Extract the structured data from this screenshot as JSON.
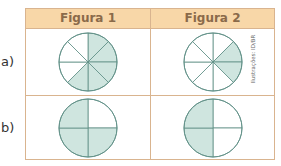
{
  "table": {
    "headers": [
      "Figura 1",
      "Figura 2"
    ],
    "rows": [
      {
        "label": "a)",
        "figures": [
          {
            "divisions": 8,
            "shaded_slices": [
              0,
              1,
              2,
              3,
              4
            ],
            "shaded_fraction": "5/8"
          },
          {
            "divisions": 8,
            "shaded_slices": [
              1,
              2
            ],
            "shaded_fraction": "2/8"
          }
        ]
      },
      {
        "label": "b)",
        "figures": [
          {
            "divisions": 4,
            "shaded_slices": [
              1,
              2,
              3
            ],
            "shaded_fraction": "3/4"
          },
          {
            "divisions": 4,
            "shaded_slices": [
              2,
              3
            ],
            "shaded_fraction": "2/4"
          }
        ]
      }
    ]
  },
  "credit": "Ilustrações: ID/BR",
  "colors": {
    "header_bg": "#f8d7a8",
    "border": "#d9b48f",
    "header_text": "#8a6a4a",
    "shade": "#cfe5df",
    "stroke": "#5f8f86"
  }
}
